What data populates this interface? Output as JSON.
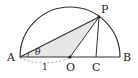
{
  "diagram": {
    "labels": {
      "A": "A",
      "B": "B",
      "O": "O",
      "C": "C",
      "P": "P",
      "theta": "θ",
      "length": "1"
    },
    "colors": {
      "stroke": "#333333",
      "shade": "#e6e6e6",
      "dashed": "#888888"
    }
  }
}
